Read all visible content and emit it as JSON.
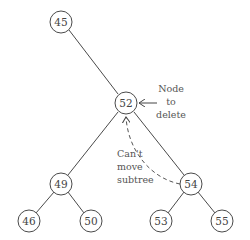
{
  "diagram": {
    "type": "binary-search-tree",
    "nodes": [
      {
        "id": "n45",
        "label": "45"
      },
      {
        "id": "n52",
        "label": "52"
      },
      {
        "id": "n49",
        "label": "49"
      },
      {
        "id": "n54",
        "label": "54"
      },
      {
        "id": "n46",
        "label": "46"
      },
      {
        "id": "n50",
        "label": "50"
      },
      {
        "id": "n53",
        "label": "53"
      },
      {
        "id": "n55",
        "label": "55"
      }
    ],
    "edges": [
      [
        "45",
        "52"
      ],
      [
        "52",
        "49"
      ],
      [
        "52",
        "54"
      ],
      [
        "49",
        "46"
      ],
      [
        "49",
        "50"
      ],
      [
        "54",
        "53"
      ],
      [
        "54",
        "55"
      ]
    ],
    "annotations": {
      "delete_label": [
        "Node",
        "to",
        "delete"
      ],
      "move_label": [
        "Can't",
        "move",
        "subtree"
      ]
    }
  }
}
